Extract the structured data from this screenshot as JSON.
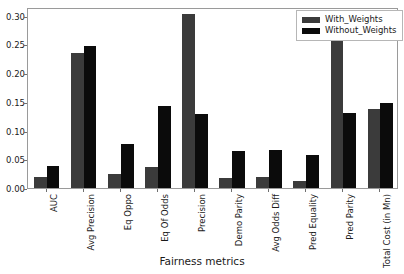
{
  "chart_data": {
    "type": "bar",
    "title": "",
    "xlabel": "Fairness metrics",
    "ylabel": "",
    "categories": [
      "AUC",
      "Avg Precision",
      "Eq Oppo",
      "Eq Of Odds",
      "Precision",
      "Demo Parity",
      "Avg Odds Diff",
      "Pred Equality",
      "Pred Parity",
      "Total Cost (in Mn)"
    ],
    "series": [
      {
        "name": "With_Weights",
        "color": "#3b3b3b",
        "values": [
          0.019,
          0.235,
          0.025,
          0.037,
          0.302,
          0.018,
          0.019,
          0.013,
          0.266,
          0.138
        ]
      },
      {
        "name": "Without_Weights",
        "color": "#0b0b0b",
        "values": [
          0.038,
          0.248,
          0.076,
          0.142,
          0.128,
          0.065,
          0.067,
          0.058,
          0.13,
          0.148
        ]
      }
    ],
    "ylim": [
      0.0,
      0.315
    ],
    "yticks": [
      0.0,
      0.05,
      0.1,
      0.15,
      0.2,
      0.25,
      0.3
    ],
    "ytick_labels": [
      "0.00",
      "0.05",
      "0.10",
      "0.15",
      "0.20",
      "0.25",
      "0.30"
    ],
    "grid": false,
    "legend_position": "upper right",
    "xtick_rotation": -90
  }
}
